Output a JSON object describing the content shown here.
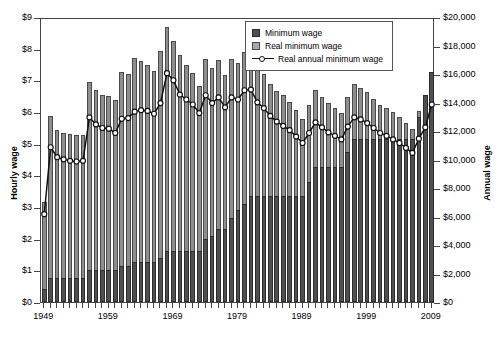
{
  "chart_data": {
    "type": "bar",
    "title": "",
    "xlabel": "",
    "ylabel": "Hourly wage",
    "ylabel_right": "Annual wage",
    "ylim": [
      0,
      9
    ],
    "ylim_right": [
      0,
      20000
    ],
    "grid": false,
    "legend_position": "top-right",
    "x_tick_labels": [
      "1949",
      "1959",
      "1969",
      "1979",
      "1989",
      "1999",
      "2009"
    ],
    "y_tick_labels": [
      "$0",
      "$1",
      "$2",
      "$3",
      "$4",
      "$5",
      "$6",
      "$7",
      "$8",
      "$9"
    ],
    "y_tick_labels_right": [
      "$0",
      "$2,000",
      "$4,000",
      "$6,000",
      "$8,000",
      "$10,000",
      "$12,000",
      "$14,000",
      "$16,000",
      "$18,000",
      "$20,000"
    ],
    "legend": [
      {
        "name": "Minimum wage",
        "marker": "bar",
        "color": "#4f4f4f"
      },
      {
        "name": "Real minimum wage",
        "marker": "bar",
        "color": "#a8a8a8"
      },
      {
        "name": "Real annual minimum wage",
        "marker": "line-open-circle",
        "color": "#111111"
      }
    ],
    "x": [
      1949,
      1950,
      1951,
      1952,
      1953,
      1954,
      1955,
      1956,
      1957,
      1958,
      1959,
      1960,
      1961,
      1962,
      1963,
      1964,
      1965,
      1966,
      1967,
      1968,
      1969,
      1970,
      1971,
      1972,
      1973,
      1974,
      1975,
      1976,
      1977,
      1978,
      1979,
      1980,
      1981,
      1982,
      1983,
      1984,
      1985,
      1986,
      1987,
      1988,
      1989,
      1990,
      1991,
      1992,
      1993,
      1994,
      1995,
      1996,
      1997,
      1998,
      1999,
      2000,
      2001,
      2002,
      2003,
      2004,
      2005,
      2006,
      2007,
      2008,
      2009
    ],
    "series": [
      {
        "name": "Minimum wage",
        "unit": "dollars per hour",
        "values": [
          0.4,
          0.75,
          0.75,
          0.75,
          0.75,
          0.75,
          0.75,
          1.0,
          1.0,
          1.0,
          1.0,
          1.0,
          1.15,
          1.15,
          1.25,
          1.25,
          1.25,
          1.25,
          1.4,
          1.6,
          1.6,
          1.6,
          1.6,
          1.6,
          1.6,
          2.0,
          2.1,
          2.3,
          2.3,
          2.65,
          2.9,
          3.1,
          3.35,
          3.35,
          3.35,
          3.35,
          3.35,
          3.35,
          3.35,
          3.35,
          3.35,
          3.8,
          4.25,
          4.25,
          4.25,
          4.25,
          4.25,
          4.75,
          5.15,
          5.15,
          5.15,
          5.15,
          5.15,
          5.15,
          5.15,
          5.15,
          5.15,
          5.15,
          5.85,
          6.55,
          7.25
        ]
      },
      {
        "name": "Real minimum wage",
        "unit": "2009 dollars per hour",
        "values": [
          3.15,
          5.87,
          5.44,
          5.33,
          5.29,
          5.26,
          5.28,
          6.94,
          6.71,
          6.53,
          6.49,
          6.38,
          7.26,
          7.19,
          7.72,
          7.62,
          7.5,
          7.29,
          7.93,
          8.7,
          8.25,
          7.8,
          7.48,
          7.24,
          6.82,
          7.68,
          7.38,
          7.64,
          7.18,
          7.67,
          7.56,
          7.9,
          7.89,
          7.43,
          7.2,
          6.9,
          6.66,
          6.54,
          6.31,
          6.06,
          5.78,
          6.22,
          6.68,
          6.48,
          6.29,
          6.14,
          5.97,
          6.48,
          6.87,
          6.77,
          6.62,
          6.41,
          6.23,
          6.13,
          5.99,
          5.84,
          5.65,
          5.47,
          6.04,
          6.43,
          7.25
        ]
      },
      {
        "name": "Real annual minimum wage",
        "unit": "2009 dollars per year",
        "values": [
          6300,
          11000,
          10300,
          10150,
          10050,
          10000,
          10050,
          13100,
          12600,
          12350,
          12300,
          12000,
          13000,
          13050,
          13500,
          13600,
          13550,
          13350,
          14100,
          16200,
          15700,
          14700,
          14350,
          14000,
          13400,
          14650,
          14100,
          14500,
          13800,
          14500,
          14350,
          15000,
          15050,
          14150,
          13750,
          13200,
          12800,
          12500,
          12200,
          11750,
          11300,
          12000,
          12750,
          12400,
          12050,
          11800,
          11550,
          12450,
          13100,
          12950,
          12700,
          12350,
          12000,
          11800,
          11550,
          11300,
          10950,
          10600,
          11600,
          12400,
          14000
        ]
      }
    ]
  }
}
